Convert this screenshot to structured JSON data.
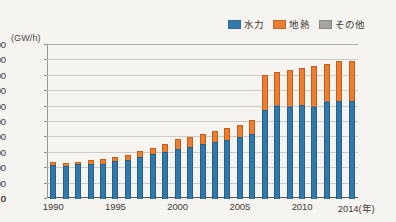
{
  "chart_data": {
    "type": "bar",
    "subtype": "stacked-bar",
    "title": "",
    "unit_label": "(GW/h)",
    "xlabel": "(年)",
    "ylabel": "",
    "ylim": [
      0,
      20000
    ],
    "ytick_step": 2000,
    "yticks": [
      0,
      2000,
      4000,
      6000,
      8000,
      10000,
      12000,
      14000,
      16000,
      18000,
      20000
    ],
    "grid": true,
    "legend_position": "top-right",
    "categories": [
      1990,
      1991,
      1992,
      1993,
      1994,
      1995,
      1996,
      1997,
      1998,
      1999,
      2000,
      2001,
      2002,
      2003,
      2004,
      2005,
      2006,
      2007,
      2008,
      2009,
      2010,
      2011,
      2012,
      2013,
      2014
    ],
    "xtick_labels": [
      "1990",
      "1995",
      "2000",
      "2005",
      "2010",
      "2014"
    ],
    "xtick_values": [
      1990,
      1995,
      2000,
      2005,
      2010,
      2014
    ],
    "xaxis_suffix": "(年)",
    "series": [
      {
        "name": "水力",
        "color": "#3079ad",
        "key": "hydro",
        "values": [
          4400,
          4300,
          4500,
          4600,
          4600,
          5000,
          5100,
          5500,
          5800,
          6100,
          6500,
          6700,
          7100,
          7400,
          7700,
          8000,
          8400,
          11500,
          12100,
          12000,
          12200,
          12000,
          12600,
          12700,
          12700
        ]
      },
      {
        "name": "地熱",
        "color": "#ed7d31",
        "key": "geo",
        "values": [
          500,
          450,
          500,
          600,
          700,
          650,
          700,
          900,
          1000,
          1200,
          1400,
          1500,
          1500,
          1600,
          1700,
          1800,
          2000,
          4700,
          4500,
          4800,
          4900,
          5300,
          5000,
          5300,
          5400
        ]
      },
      {
        "name": "その他",
        "color": "#a5a5a5",
        "key": "other",
        "values": [
          0,
          0,
          0,
          0,
          0,
          0,
          0,
          0,
          0,
          0,
          0,
          0,
          0,
          0,
          0,
          0,
          0,
          200,
          200,
          200,
          200,
          200,
          200,
          200,
          0
        ]
      }
    ],
    "totals": [
      4900,
      4750,
      5000,
      5200,
      5300,
      5650,
      5800,
      6400,
      6800,
      7300,
      7900,
      8200,
      8600,
      9000,
      9400,
      9800,
      10400,
      16400,
      16800,
      17000,
      17300,
      17500,
      17800,
      18200,
      18100
    ]
  }
}
